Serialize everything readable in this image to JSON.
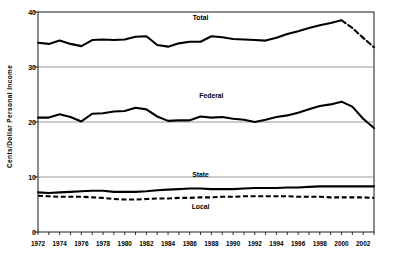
{
  "chart_data": {
    "type": "line",
    "title": "",
    "xlabel": "",
    "ylabel": "Cents/Dollar Personal Income",
    "xlim": [
      1972,
      2003
    ],
    "ylim": [
      0,
      40
    ],
    "yticks": [
      0,
      10,
      20,
      30,
      40
    ],
    "ytick_labels": [
      "0",
      "10",
      "20",
      "30",
      "40"
    ],
    "grid": "horizontal gridlines at 10, 20, 30",
    "legend": "inline series labels on plot",
    "x": [
      1972,
      1973,
      1974,
      1975,
      1976,
      1977,
      1978,
      1979,
      1980,
      1981,
      1982,
      1983,
      1984,
      1985,
      1986,
      1987,
      1988,
      1989,
      1990,
      1991,
      1992,
      1993,
      1994,
      1995,
      1996,
      1997,
      1998,
      1999,
      2000,
      2001,
      2002,
      2003
    ],
    "xtick_labels": [
      "1972",
      "1974",
      "1976",
      "1978",
      "1980",
      "1982",
      "1984",
      "1986",
      "1988",
      "1990",
      "1992",
      "1994",
      "1996",
      "1998",
      "2000",
      "2002"
    ],
    "xticks": [
      1972,
      1974,
      1976,
      1978,
      1980,
      1982,
      1984,
      1986,
      1988,
      1990,
      1992,
      1994,
      1996,
      1998,
      2000,
      2002
    ],
    "series": [
      {
        "name": "Total",
        "style": "solid-then-dashed",
        "dash_from": 2000,
        "label_x": 1987,
        "label_y": 39.0,
        "values": [
          34.4,
          34.2,
          34.8,
          34.2,
          33.8,
          34.9,
          35.0,
          34.9,
          35.0,
          35.5,
          35.6,
          34.0,
          33.7,
          34.3,
          34.6,
          34.6,
          35.6,
          35.4,
          35.1,
          35.0,
          34.9,
          34.8,
          35.3,
          36.0,
          36.5,
          37.1,
          37.6,
          38.0,
          38.5,
          37.1,
          35.3,
          33.6
        ]
      },
      {
        "name": "Federal",
        "style": "solid",
        "label_x": 1988,
        "label_y": 24.8,
        "values": [
          20.8,
          20.8,
          21.4,
          20.9,
          20.1,
          21.5,
          21.6,
          21.9,
          22.0,
          22.6,
          22.3,
          21.0,
          20.2,
          20.3,
          20.3,
          21.0,
          20.8,
          20.9,
          20.6,
          20.4,
          20.0,
          20.4,
          20.9,
          21.2,
          21.7,
          22.3,
          22.9,
          23.2,
          23.7,
          22.8,
          20.6,
          18.9
        ]
      },
      {
        "name": "State",
        "style": "solid",
        "label_x": 1987,
        "label_y": 10.4,
        "values": [
          7.2,
          7.1,
          7.2,
          7.3,
          7.4,
          7.5,
          7.5,
          7.3,
          7.3,
          7.3,
          7.4,
          7.6,
          7.7,
          7.8,
          7.9,
          7.9,
          7.8,
          7.8,
          7.8,
          7.9,
          8.0,
          8.0,
          8.0,
          8.1,
          8.1,
          8.2,
          8.3,
          8.3,
          8.3,
          8.3,
          8.3,
          8.3
        ]
      },
      {
        "name": "Local",
        "style": "dashed",
        "label_x": 1987,
        "label_y": 4.6,
        "values": [
          6.6,
          6.5,
          6.4,
          6.4,
          6.4,
          6.3,
          6.2,
          6.0,
          5.9,
          5.9,
          6.0,
          6.1,
          6.1,
          6.2,
          6.2,
          6.3,
          6.3,
          6.4,
          6.4,
          6.5,
          6.5,
          6.5,
          6.5,
          6.5,
          6.4,
          6.4,
          6.4,
          6.3,
          6.3,
          6.3,
          6.3,
          6.2
        ]
      }
    ],
    "colors": {
      "line": "#000000",
      "grid": "#808080",
      "axis": "#000000",
      "background": "#ffffff"
    }
  }
}
